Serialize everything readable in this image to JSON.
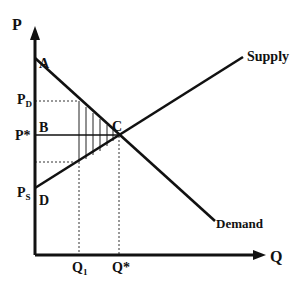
{
  "diagram": {
    "type": "supply-demand",
    "axes": {
      "y_label": "P",
      "x_label": "Q"
    },
    "curves": {
      "supply_label": "Supply",
      "demand_label": "Demand"
    },
    "points": {
      "A": "A",
      "B": "B",
      "C": "C",
      "D": "D"
    },
    "price_labels": {
      "pd_main": "P",
      "pd_sub": "D",
      "pstar": "P*",
      "ps_main": "P",
      "ps_sub": "S"
    },
    "quantity_labels": {
      "q1_main": "Q",
      "q1_sub": "1",
      "qstar": "Q*"
    },
    "colors": {
      "line": "#111111",
      "background": "#ffffff"
    }
  }
}
